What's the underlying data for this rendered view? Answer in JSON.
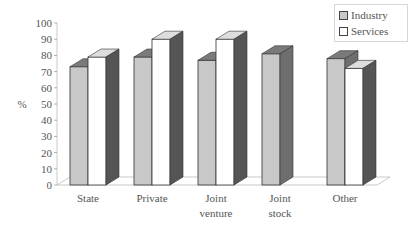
{
  "chart_data": {
    "type": "bar",
    "style": "3d-clustered",
    "title": "",
    "xlabel": "",
    "ylabel": "%",
    "ylim": [
      0,
      100
    ],
    "yticks": [
      0,
      10,
      20,
      30,
      40,
      50,
      60,
      70,
      80,
      90,
      100
    ],
    "categories": [
      "State",
      "Private",
      "Joint venture",
      "Joint stock",
      "Other"
    ],
    "category_label_lines": [
      [
        "State"
      ],
      [
        "Private"
      ],
      [
        "Joint",
        "venture"
      ],
      [
        "Joint",
        "stock"
      ],
      [
        "Other"
      ]
    ],
    "series": [
      {
        "name": "Industry",
        "values": [
          73,
          79,
          77,
          81,
          78
        ],
        "color": "#c8c8c8"
      },
      {
        "name": "Services",
        "values": [
          79,
          90,
          90,
          null,
          72
        ],
        "color": "#ffffff"
      }
    ],
    "legend_position": "top-right",
    "grid": false
  },
  "legend": {
    "items": [
      {
        "label": "Industry"
      },
      {
        "label": "Services"
      }
    ]
  }
}
